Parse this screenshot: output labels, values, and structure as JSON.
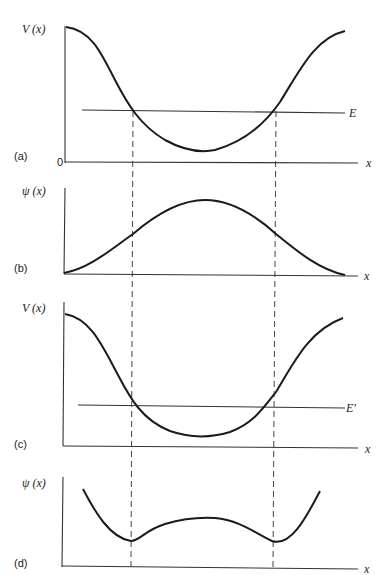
{
  "figure": {
    "panels": [
      {
        "id": "a",
        "label": "(a)",
        "y_label": "V (x)",
        "x_label": "x",
        "origin_label": "0",
        "energy_label": "E",
        "curve": "potential V(x), symmetric well with energy E above minimum"
      },
      {
        "id": "b",
        "label": "(b)",
        "y_label": "ψ (x)",
        "x_label": "x",
        "curve": "wavefunction ψ(x), single hump, decaying to zero at both ends"
      },
      {
        "id": "c",
        "label": "(c)",
        "y_label": "V (x)",
        "x_label": "x",
        "energy_label": "E′",
        "curve": "potential V(x) with lower energy E′"
      },
      {
        "id": "d",
        "label": "(d)",
        "y_label": "ψ (x)",
        "x_label": "x",
        "curve": "wavefunction ψ(x) with kinks at turning points, diverging outside"
      }
    ],
    "turning_points_x_px": [
      133,
      273
    ]
  },
  "colors": {
    "ink": "#1a1a1a",
    "background": "#ffffff"
  }
}
